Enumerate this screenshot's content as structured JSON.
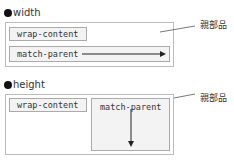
{
  "width_section": {
    "heading": "width",
    "parent_label": "親部品",
    "children": [
      {
        "label": "wrap-content"
      },
      {
        "label": "match-parent"
      }
    ]
  },
  "height_section": {
    "heading": "height",
    "parent_label": "親部品",
    "children": [
      {
        "label": "wrap-content"
      },
      {
        "label": "match-parent"
      }
    ]
  }
}
